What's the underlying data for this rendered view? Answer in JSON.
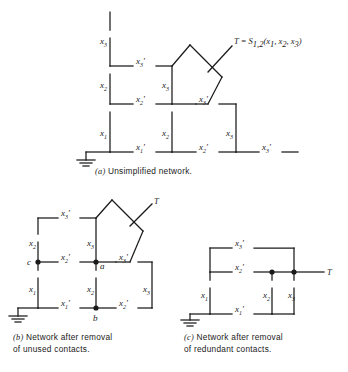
{
  "figure": {
    "title_label": "T = S",
    "output_symbol": "T"
  },
  "panels": [
    {
      "id": "a",
      "tag": "(a)",
      "caption": "Unsimplified network.",
      "output_label": {
        "prefix": "T = S",
        "function_subscript": "1,2",
        "args": "(x1, x2, x3)",
        "full": "T = S1,2(x1, x2, x3)"
      },
      "contacts": [
        {
          "name": "x3-top-left",
          "base": "x",
          "sub": "3",
          "primed": false
        },
        {
          "name": "x3p-row1",
          "base": "x",
          "sub": "3",
          "primed": true
        },
        {
          "name": "x2-row2-left",
          "base": "x",
          "sub": "2",
          "primed": false
        },
        {
          "name": "x3-row2-mid",
          "base": "x",
          "sub": "3",
          "primed": false
        },
        {
          "name": "x2p-row3-left",
          "base": "x",
          "sub": "2",
          "primed": true
        },
        {
          "name": "x3p-row3-mid",
          "base": "x",
          "sub": "3",
          "primed": true
        },
        {
          "name": "x1-row4-left",
          "base": "x",
          "sub": "1",
          "primed": false
        },
        {
          "name": "x2-row4-mid",
          "base": "x",
          "sub": "2",
          "primed": false
        },
        {
          "name": "x3-row4-right",
          "base": "x",
          "sub": "3",
          "primed": false
        },
        {
          "name": "x1p-bottom-left",
          "base": "x",
          "sub": "1",
          "primed": true
        },
        {
          "name": "x2p-bottom-mid",
          "base": "x",
          "sub": "2",
          "primed": true
        },
        {
          "name": "x3p-bottom-right",
          "base": "x",
          "sub": "3",
          "primed": true
        }
      ],
      "nodes": [],
      "has_ground": true
    },
    {
      "id": "b",
      "tag": "(b)",
      "caption_line1": "Network after removal",
      "caption_line2": "of unused contacts.",
      "output_label": {
        "full": "T"
      },
      "contacts": [
        {
          "name": "x3p-row1",
          "base": "x",
          "sub": "3",
          "primed": true
        },
        {
          "name": "x2-row2-left",
          "base": "x",
          "sub": "2",
          "primed": false
        },
        {
          "name": "x3-row2-mid",
          "base": "x",
          "sub": "3",
          "primed": false
        },
        {
          "name": "x2p-row3-left",
          "base": "x",
          "sub": "2",
          "primed": true
        },
        {
          "name": "x3p-row3-mid",
          "base": "x",
          "sub": "3",
          "primed": true
        },
        {
          "name": "x1-row4-left",
          "base": "x",
          "sub": "1",
          "primed": false
        },
        {
          "name": "x2-row4-mid",
          "base": "x",
          "sub": "2",
          "primed": false
        },
        {
          "name": "x3-row4-right",
          "base": "x",
          "sub": "3",
          "primed": false
        },
        {
          "name": "x1p-bottom",
          "base": "x",
          "sub": "1",
          "primed": true
        },
        {
          "name": "x2p-bottom",
          "base": "x",
          "sub": "2",
          "primed": true
        }
      ],
      "nodes": [
        {
          "name": "node-c",
          "label": "c"
        },
        {
          "name": "node-a",
          "label": "a"
        },
        {
          "name": "node-b",
          "label": "b"
        }
      ],
      "has_ground": true
    },
    {
      "id": "c",
      "tag": "(c)",
      "caption_line1": "Network after removal",
      "caption_line2": "of redundant contacts.",
      "output_label": {
        "full": "T"
      },
      "contacts": [
        {
          "name": "x3p-top",
          "base": "x",
          "sub": "3",
          "primed": true
        },
        {
          "name": "x2p-mid",
          "base": "x",
          "sub": "2",
          "primed": true
        },
        {
          "name": "x1-left",
          "base": "x",
          "sub": "1",
          "primed": false
        },
        {
          "name": "x2-branch",
          "base": "x",
          "sub": "2",
          "primed": false
        },
        {
          "name": "x3-branch",
          "base": "x",
          "sub": "3",
          "primed": false
        },
        {
          "name": "x1p-bottom",
          "base": "x",
          "sub": "1",
          "primed": true
        }
      ],
      "nodes": [
        {
          "name": "node-junction-left",
          "label": ""
        },
        {
          "name": "node-junction-right",
          "label": ""
        }
      ],
      "has_ground": true
    }
  ],
  "colors": {
    "ink": "#1a1a1a",
    "background": "#ffffff"
  }
}
